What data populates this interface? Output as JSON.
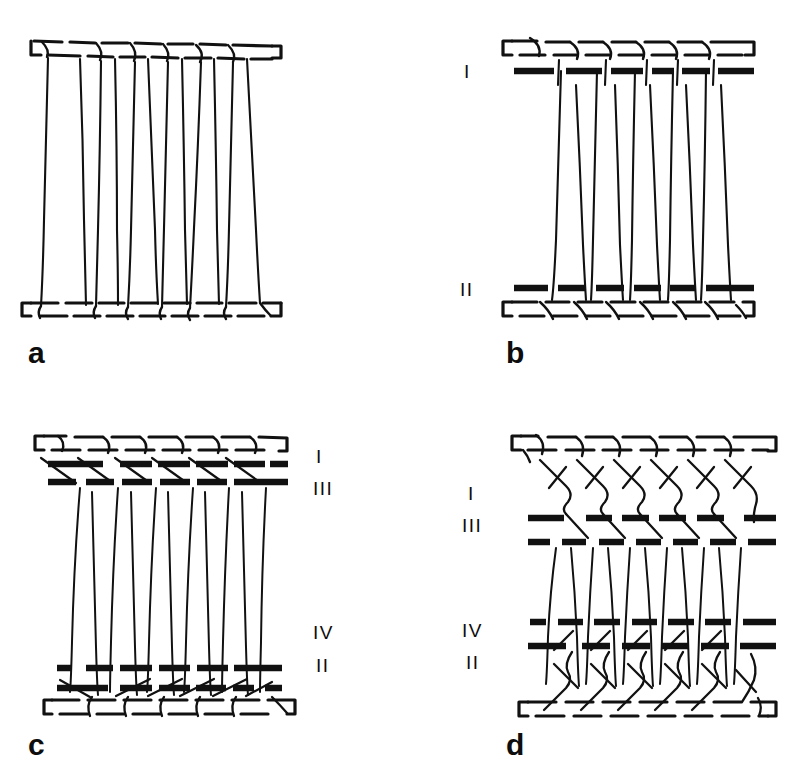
{
  "figure": {
    "kind": "line-drawing-diagram",
    "background_color": "#ffffff",
    "ink_color": "#111111",
    "width": 812,
    "height": 784
  },
  "panels": [
    {
      "id": "a",
      "letter": "a",
      "letter_x": 28,
      "letter_y": 338,
      "origin_x": 0,
      "origin_y": 0,
      "course_count": 0,
      "wale_count": 7,
      "top_rail_y": 48,
      "bottom_rail_y": 305,
      "row_labels": []
    },
    {
      "id": "b",
      "letter": "b",
      "letter_x": 506,
      "letter_y": 338,
      "origin_x": 406,
      "origin_y": 0,
      "course_count": 2,
      "wale_count": 7,
      "top_rail_y": 48,
      "bottom_rail_y": 305,
      "row_labels": [
        {
          "text": "I",
          "x": 464,
          "y": 62,
          "side": "left"
        },
        {
          "text": "II",
          "x": 460,
          "y": 280,
          "side": "left"
        }
      ]
    },
    {
      "id": "c",
      "letter": "c",
      "letter_x": 28,
      "letter_y": 730,
      "origin_x": 0,
      "origin_y": 392,
      "course_count": 4,
      "wale_count": 6,
      "top_rail_y": 440,
      "bottom_rail_y": 700,
      "row_labels": [
        {
          "text": "I",
          "x": 316,
          "y": 447,
          "side": "right"
        },
        {
          "text": "III",
          "x": 313,
          "y": 479,
          "side": "right"
        },
        {
          "text": "IV",
          "x": 313,
          "y": 623,
          "side": "right"
        },
        {
          "text": "II",
          "x": 316,
          "y": 656,
          "side": "right"
        }
      ]
    },
    {
      "id": "d",
      "letter": "d",
      "letter_x": 506,
      "letter_y": 730,
      "origin_x": 406,
      "origin_y": 392,
      "course_count": 4,
      "wale_count": 6,
      "top_rail_y": 440,
      "bottom_rail_y": 710,
      "row_labels": [
        {
          "text": "I",
          "x": 468,
          "y": 484,
          "side": "left"
        },
        {
          "text": "III",
          "x": 462,
          "y": 516,
          "side": "left"
        },
        {
          "text": "IV",
          "x": 462,
          "y": 621,
          "side": "left"
        },
        {
          "text": "II",
          "x": 466,
          "y": 653,
          "side": "left"
        }
      ]
    }
  ],
  "legend": {
    "roman_numerals": [
      "I",
      "II",
      "III",
      "IV"
    ],
    "panel_letters": [
      "a",
      "b",
      "c",
      "d"
    ]
  }
}
